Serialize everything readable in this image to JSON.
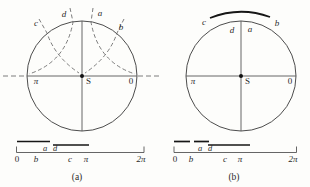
{
  "colors": {
    "stroke": "#4d4d4d",
    "dashed": "#6e6e6e",
    "bold_bar": "#161616",
    "text": "#2b2b2b",
    "background": "#fdfdfb"
  },
  "panel_a": {
    "caption": "(a)",
    "arc_labels": {
      "c": "c",
      "d": "d",
      "a": "a",
      "b": "b"
    },
    "center_label": "S",
    "diameter_labels": {
      "left": "π",
      "right": "0"
    },
    "number_line": {
      "ticks": [
        "0",
        "b",
        "c",
        "π",
        "2π"
      ],
      "interval_labels": {
        "a": "a",
        "d": "d"
      }
    }
  },
  "panel_b": {
    "caption": "(b)",
    "arc_labels": {
      "c": "c",
      "d": "d",
      "a": "a",
      "b": "b"
    },
    "center_label": "S",
    "diameter_labels": {
      "left": "π",
      "right": "0"
    },
    "number_line": {
      "ticks": [
        "0",
        "b",
        "c",
        "π",
        "2π"
      ],
      "interval_labels": {
        "a": "a",
        "d": "d"
      }
    }
  }
}
